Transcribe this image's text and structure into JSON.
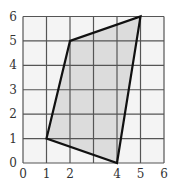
{
  "chart_data": {
    "type": "scatter",
    "subtype": "polygon-on-grid",
    "title": "",
    "xlabel": "",
    "ylabel": "",
    "xlim": [
      0,
      6
    ],
    "ylim": [
      0,
      6
    ],
    "grid": true,
    "x_ticks": [
      "0",
      "1",
      "2",
      "4",
      "5",
      "6"
    ],
    "y_ticks": [
      "0",
      "1",
      "2",
      "3",
      "4",
      "5",
      "6"
    ],
    "polygon": {
      "vertices": [
        [
          1,
          1
        ],
        [
          2,
          5
        ],
        [
          5,
          6
        ],
        [
          4,
          0
        ]
      ],
      "fill": "#dcdcdc",
      "stroke": "#111111"
    }
  },
  "colors": {
    "background": "#ffffff",
    "plot_background": "#f4f4f4",
    "grid": "#555555",
    "fill": "#dcdcdc",
    "stroke": "#111111",
    "text": "#333333"
  }
}
